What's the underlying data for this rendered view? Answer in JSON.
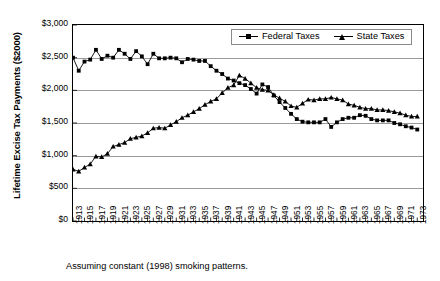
{
  "chart_data": {
    "type": "line",
    "title": "",
    "xlabel": "",
    "ylabel": "Lifetime Excise Tax Payments ($2000)",
    "footnote": "Assuming constant (1998) smoking patterns.",
    "xlim": [
      1913,
      1974
    ],
    "ylim": [
      0,
      3000
    ],
    "ytick_values": [
      0,
      500,
      1000,
      1500,
      2000,
      2500,
      3000
    ],
    "ytick_labels": [
      "$0",
      "$500",
      "$1,000",
      "$1,500",
      "$2,000",
      "$2,500",
      "$3,000"
    ],
    "grid": true,
    "legend_position": "top-right",
    "x": [
      1913,
      1914,
      1915,
      1916,
      1917,
      1918,
      1919,
      1920,
      1921,
      1922,
      1923,
      1924,
      1925,
      1926,
      1927,
      1928,
      1929,
      1930,
      1931,
      1932,
      1933,
      1934,
      1935,
      1936,
      1937,
      1938,
      1939,
      1940,
      1941,
      1942,
      1943,
      1944,
      1945,
      1946,
      1947,
      1948,
      1949,
      1950,
      1951,
      1952,
      1953,
      1954,
      1955,
      1956,
      1957,
      1958,
      1959,
      1960,
      1961,
      1962,
      1963,
      1964,
      1965,
      1966,
      1967,
      1968,
      1969,
      1970,
      1971,
      1972,
      1973
    ],
    "xtick_labels": [
      "1913",
      "1915",
      "1917",
      "1919",
      "1921",
      "1923",
      "1925",
      "1927",
      "1929",
      "1931",
      "1933",
      "1935",
      "1937",
      "1939",
      "1941",
      "1943",
      "1945",
      "1947",
      "1949",
      "1951",
      "1953",
      "1955",
      "1957",
      "1959",
      "1961",
      "1963",
      "1965",
      "1967",
      "1969",
      "1971",
      "1973"
    ],
    "series": [
      {
        "name": "Federal Taxes",
        "marker": "square",
        "color": "#000000",
        "values": [
          2500,
          2300,
          2440,
          2470,
          2620,
          2480,
          2530,
          2500,
          2620,
          2560,
          2480,
          2600,
          2520,
          2400,
          2560,
          2490,
          2490,
          2500,
          2490,
          2430,
          2480,
          2470,
          2450,
          2450,
          2370,
          2300,
          2250,
          2180,
          2150,
          2110,
          2080,
          2020,
          1950,
          2090,
          2050,
          1920,
          1820,
          1730,
          1640,
          1560,
          1520,
          1510,
          1510,
          1510,
          1560,
          1440,
          1510,
          1560,
          1580,
          1580,
          1620,
          1610,
          1560,
          1540,
          1540,
          1540,
          1500,
          1480,
          1450,
          1430,
          1400
        ]
      },
      {
        "name": "State Taxes",
        "marker": "triangle",
        "color": "#000000",
        "values": [
          790,
          760,
          820,
          870,
          990,
          980,
          1030,
          1140,
          1170,
          1200,
          1260,
          1280,
          1300,
          1350,
          1420,
          1430,
          1420,
          1470,
          1520,
          1580,
          1620,
          1670,
          1720,
          1780,
          1830,
          1870,
          1960,
          2040,
          2080,
          2230,
          2180,
          2110,
          2040,
          2010,
          2000,
          1930,
          1880,
          1830,
          1760,
          1740,
          1800,
          1860,
          1850,
          1870,
          1870,
          1890,
          1870,
          1850,
          1790,
          1770,
          1740,
          1720,
          1720,
          1700,
          1700,
          1690,
          1670,
          1650,
          1620,
          1600,
          1600
        ]
      }
    ]
  },
  "legend": {
    "items": [
      {
        "label": "Federal Taxes"
      },
      {
        "label": "State Taxes"
      }
    ]
  }
}
